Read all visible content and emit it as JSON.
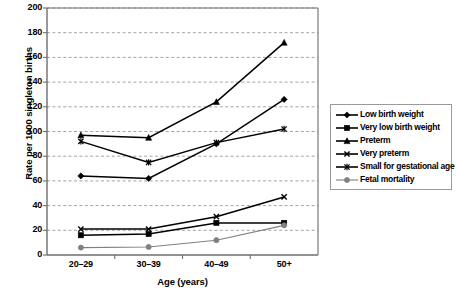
{
  "chart_data": {
    "type": "line",
    "title": "",
    "xlabel": "Age (years)",
    "ylabel": "Rate per 1000 singleton births",
    "categories": [
      "20–29",
      "30–39",
      "40–49",
      "50+"
    ],
    "ylim": [
      0,
      200
    ],
    "ytick_step": 20,
    "yticks": [
      0,
      20,
      40,
      60,
      80,
      100,
      120,
      140,
      160,
      180,
      200
    ],
    "grid": "horizontal-dashed",
    "legend_position": "right",
    "series": [
      {
        "name": "Low birth weight",
        "marker": "diamond",
        "color": "#000000",
        "values": [
          64,
          62,
          90,
          126
        ]
      },
      {
        "name": "Very low birth weight",
        "marker": "square",
        "color": "#000000",
        "values": [
          16,
          17,
          26,
          26
        ]
      },
      {
        "name": "Preterm",
        "marker": "triangle",
        "color": "#000000",
        "values": [
          97,
          95,
          124,
          172
        ]
      },
      {
        "name": "Very preterm",
        "marker": "cross",
        "color": "#000000",
        "values": [
          21,
          21,
          31,
          47
        ]
      },
      {
        "name": "Small for gestational age",
        "marker": "asterisk",
        "color": "#000000",
        "values": [
          92,
          75,
          91,
          102
        ]
      },
      {
        "name": "Fetal mortality",
        "marker": "circle",
        "color": "#808080",
        "values": [
          6,
          6.5,
          12,
          24
        ]
      }
    ]
  },
  "axes": {
    "y_title": "Rate per 1000 singleton births",
    "x_title": "Age (years)",
    "y_labels": [
      "200",
      "180",
      "160",
      "140",
      "120",
      "100",
      "80",
      "60",
      "40",
      "20",
      "0"
    ],
    "x_labels": [
      "20–29",
      "30–39",
      "40–49",
      "50+"
    ]
  },
  "legend": {
    "items": [
      {
        "label": "Low birth weight",
        "icon": "diamond-marker-icon"
      },
      {
        "label": "Very low birth weight",
        "icon": "square-marker-icon"
      },
      {
        "label": "Preterm",
        "icon": "triangle-marker-icon"
      },
      {
        "label": "Very preterm",
        "icon": "cross-marker-icon"
      },
      {
        "label": "Small for gestational age",
        "icon": "asterisk-marker-icon"
      },
      {
        "label": "Fetal mortality",
        "icon": "circle-marker-icon"
      }
    ]
  },
  "colors": {
    "axis": "#6e6e6e",
    "grid": "#8c8c8c",
    "series_dark": "#000000",
    "series_gray": "#808080",
    "legend_border": "#9a9a9a"
  }
}
